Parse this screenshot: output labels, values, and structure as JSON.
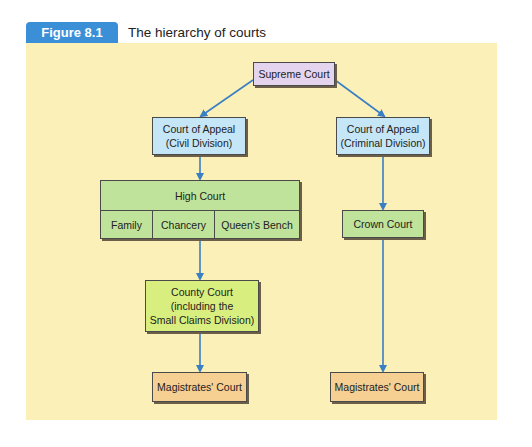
{
  "figure": {
    "label": "Figure 8.1",
    "title": "The hierarchy of courts"
  },
  "nodes": {
    "supreme_court": "Supreme Court",
    "coa_civil": {
      "line1": "Court of Appeal",
      "line2": "(Civil Division)"
    },
    "coa_criminal": {
      "line1": "Court of Appeal",
      "line2": "(Criminal Division)"
    },
    "high_court": {
      "title": "High Court",
      "divisions": [
        "Family",
        "Chancery",
        "Queen's Bench"
      ]
    },
    "county_court": {
      "line1": "County Court",
      "line2": "(including the",
      "line3": "Small Claims Division)"
    },
    "crown_court": "Crown Court",
    "magistrates_civil": "Magistrates' Court",
    "magistrates_criminal": "Magistrates' Court"
  },
  "colors": {
    "badge": "#3b8fd6",
    "panel": "#fbf0b8",
    "arrow": "#3a7fc4",
    "supreme": "#e4d4ee",
    "appeal": "#c5e6f7",
    "high": "#bfe39a",
    "county": "#d8ee7e",
    "magistrates": "#f6cf92"
  }
}
